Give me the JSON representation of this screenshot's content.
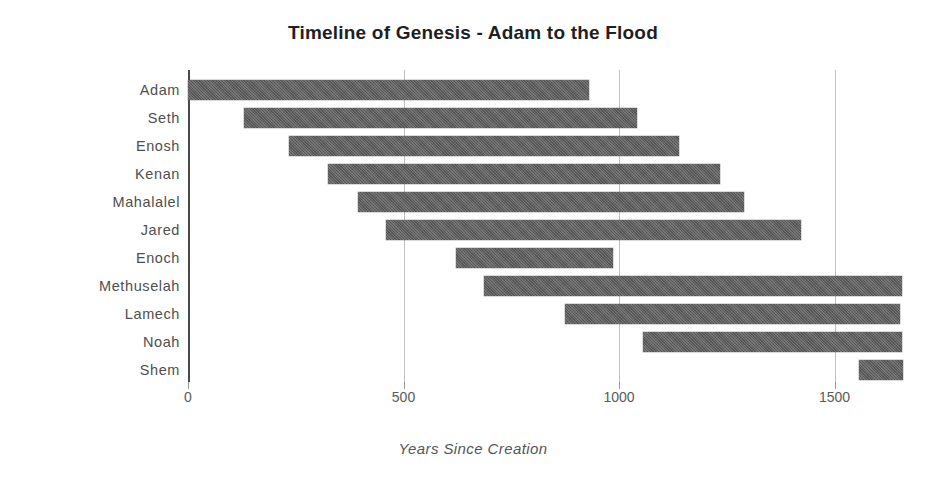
{
  "chart_data": {
    "type": "bar",
    "subtype": "gantt-range-bar",
    "title": "Timeline of Genesis - Adam to the Flood",
    "xlabel": "Years Since Creation",
    "ylabel": "",
    "orientation": "horizontal",
    "grid": true,
    "legend": "none",
    "xlim": [
      0,
      1665
    ],
    "xticks": [
      0,
      500,
      1000,
      1500
    ],
    "xticklabels": [
      "0",
      "500",
      "1000",
      "1500"
    ],
    "categories": [
      "Adam",
      "Seth",
      "Enosh",
      "Kenan",
      "Mahalalel",
      "Jared",
      "Enoch",
      "Methuselah",
      "Lamech",
      "Noah",
      "Shem"
    ],
    "bar_color": "#5e5e5e",
    "grid_color": "#c8c8c8",
    "axis_color": "#4a4a4a",
    "title_color": "#1f1f1f",
    "series": [
      {
        "name": "Lifespan",
        "ranges": [
          {
            "label": "Adam",
            "start": 0,
            "end": 930,
            "duration": 930
          },
          {
            "label": "Seth",
            "start": 130,
            "end": 1042,
            "duration": 912
          },
          {
            "label": "Enosh",
            "start": 235,
            "end": 1140,
            "duration": 905
          },
          {
            "label": "Kenan",
            "start": 325,
            "end": 1235,
            "duration": 910
          },
          {
            "label": "Mahalalel",
            "start": 395,
            "end": 1290,
            "duration": 895
          },
          {
            "label": "Jared",
            "start": 460,
            "end": 1422,
            "duration": 962
          },
          {
            "label": "Enoch",
            "start": 622,
            "end": 987,
            "duration": 365
          },
          {
            "label": "Methuselah",
            "start": 687,
            "end": 1656,
            "duration": 969
          },
          {
            "label": "Lamech",
            "start": 874,
            "end": 1651,
            "duration": 777
          },
          {
            "label": "Noah",
            "start": 1056,
            "end": 1656,
            "duration": 600
          },
          {
            "label": "Shem",
            "start": 1558,
            "end": 1658,
            "duration": 100
          }
        ]
      }
    ]
  }
}
